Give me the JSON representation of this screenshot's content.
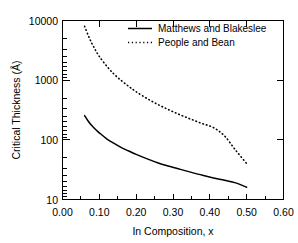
{
  "chart_data": {
    "type": "line",
    "title": "",
    "xlabel": "In Composition, x",
    "ylabel": "Critical Thickness (Å)",
    "xlim": [
      0.0,
      0.6
    ],
    "ylim": [
      10,
      10000
    ],
    "yscale": "log",
    "xscale": "linear",
    "grid": false,
    "legend_position": "top-right",
    "xticks": [
      "0.00",
      "0.10",
      "0.20",
      "0.30",
      "0.40",
      "0.50",
      "0.60"
    ],
    "xtick_values": [
      0.0,
      0.1,
      0.2,
      0.3,
      0.4,
      0.5,
      0.6
    ],
    "x_minor_tick_step": 0.05,
    "yticks": [
      "10",
      "100",
      "1000",
      "10000"
    ],
    "ytick_values": [
      10,
      100,
      1000,
      10000
    ],
    "series": [
      {
        "name": "Matthews and Blakeslee",
        "style": "solid",
        "color": "#000000",
        "x": [
          0.06,
          0.07,
          0.08,
          0.09,
          0.1,
          0.12,
          0.14,
          0.16,
          0.18,
          0.2,
          0.23,
          0.26,
          0.29,
          0.32,
          0.35,
          0.38,
          0.41,
          0.44,
          0.47,
          0.5
        ],
        "values": [
          255,
          205,
          172,
          149,
          131,
          104,
          87,
          74,
          65,
          57,
          48,
          41,
          36,
          32,
          28.5,
          25.5,
          23,
          21,
          19,
          16
        ]
      },
      {
        "name": "People and Bean",
        "style": "dotted",
        "color": "#000000",
        "x": [
          0.06,
          0.07,
          0.08,
          0.09,
          0.1,
          0.12,
          0.14,
          0.16,
          0.18,
          0.2,
          0.23,
          0.26,
          0.29,
          0.32,
          0.35,
          0.38,
          0.41,
          0.44,
          0.47,
          0.5
        ],
        "values": [
          8000,
          5600,
          4100,
          3150,
          2500,
          1720,
          1260,
          980,
          785,
          640,
          490,
          388,
          316,
          262,
          220,
          187,
          160,
          116,
          67,
          40
        ]
      }
    ]
  },
  "legend": {
    "entries": [
      {
        "label": "Matthews and Blakeslee",
        "style": "solid"
      },
      {
        "label": "People and Bean",
        "style": "dotted"
      }
    ]
  },
  "axes": {
    "y_title": "Critical Thickness (Å)",
    "x_title": "In Composition, x",
    "y_labels": [
      "10000",
      "1000",
      "100",
      "10"
    ],
    "x_labels": [
      "0.00",
      "0.10",
      "0.20",
      "0.30",
      "0.40",
      "0.50",
      "0.60"
    ]
  },
  "colors": {
    "foreground": "#000000",
    "background": "#ffffff"
  }
}
